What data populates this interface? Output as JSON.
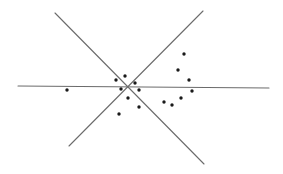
{
  "diagram": {
    "type": "line-arrangement-with-points",
    "width": 283,
    "height": 174,
    "colors": {
      "background": "#ffffff",
      "line": "#6b6b6b",
      "point": "#1a1a1a"
    },
    "intersection": {
      "x": 128,
      "y": 87
    },
    "lines": [
      {
        "id": "horizontal",
        "x1": 18,
        "y1": 86,
        "x2": 269,
        "y2": 88
      },
      {
        "id": "diagonal-descending",
        "x1": 55,
        "y1": 13,
        "x2": 204,
        "y2": 164
      },
      {
        "id": "diagonal-ascending",
        "x1": 203,
        "y1": 11,
        "x2": 69,
        "y2": 146
      }
    ],
    "points": [
      {
        "x": 67,
        "y": 90
      },
      {
        "x": 116,
        "y": 80
      },
      {
        "x": 125,
        "y": 76
      },
      {
        "x": 121,
        "y": 89
      },
      {
        "x": 135,
        "y": 83
      },
      {
        "x": 139,
        "y": 90
      },
      {
        "x": 128,
        "y": 98
      },
      {
        "x": 139,
        "y": 107
      },
      {
        "x": 119,
        "y": 114
      },
      {
        "x": 164,
        "y": 102
      },
      {
        "x": 172,
        "y": 105
      },
      {
        "x": 181,
        "y": 98
      },
      {
        "x": 184,
        "y": 54
      },
      {
        "x": 178,
        "y": 70
      },
      {
        "x": 189,
        "y": 80
      },
      {
        "x": 192,
        "y": 91
      }
    ]
  }
}
